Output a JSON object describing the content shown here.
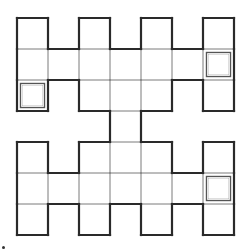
{
  "puzzle": {
    "type": "grid-shape",
    "rows": 7,
    "cols": 7,
    "cell_size": 31,
    "origin": {
      "x": 17,
      "y": 18
    },
    "colors": {
      "outline": "#2a2a2a",
      "inner_line": "#7a7a7a",
      "marked_cell_border": "#555555",
      "background": "#ffffff"
    },
    "cells": [
      [
        1,
        0,
        1,
        0,
        1,
        0,
        1
      ],
      [
        1,
        1,
        1,
        1,
        1,
        1,
        1
      ],
      [
        1,
        0,
        1,
        1,
        1,
        0,
        1
      ],
      [
        0,
        0,
        0,
        1,
        0,
        0,
        0
      ],
      [
        1,
        0,
        1,
        1,
        1,
        0,
        1
      ],
      [
        1,
        1,
        1,
        1,
        1,
        1,
        1
      ],
      [
        1,
        0,
        1,
        0,
        1,
        0,
        1
      ]
    ],
    "marked_cells": [
      {
        "row": 2,
        "col": 0
      },
      {
        "row": 1,
        "col": 6
      },
      {
        "row": 5,
        "col": 6
      }
    ]
  }
}
